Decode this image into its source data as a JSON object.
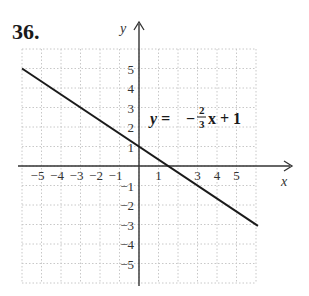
{
  "problem_number": "36.",
  "chart_data": {
    "type": "line",
    "title": "",
    "equation": "y = -2/3 x + 1",
    "equation_parts": {
      "lhs": "y =",
      "sign": "−",
      "num": "2",
      "den": "3",
      "rest": "x + 1"
    },
    "xlabel": "x",
    "ylabel": "y",
    "xlim": [
      -6,
      6
    ],
    "ylim": [
      -6,
      6
    ],
    "grid": true,
    "grid_style": "dotted",
    "x_ticks": [
      "−5",
      "−4",
      "−3",
      "−2",
      "−1",
      "1",
      "3",
      "4",
      "5"
    ],
    "y_ticks": [
      "5",
      "4",
      "3",
      "2",
      "1",
      "−1",
      "−2",
      "−3",
      "−4",
      "−5"
    ],
    "series": [
      {
        "name": "y = -2/3x + 1",
        "x": [
          -6,
          6.1
        ],
        "y": [
          5,
          -3.07
        ],
        "slope": -0.6667,
        "intercept": 1
      }
    ],
    "intercepts": {
      "y_intercept": [
        0,
        1
      ],
      "x_intercept": [
        1.5,
        0
      ]
    }
  }
}
